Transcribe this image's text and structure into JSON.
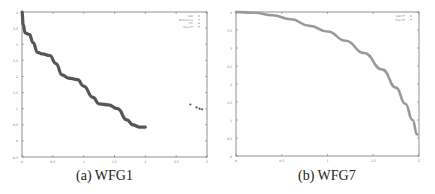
{
  "chart_data": [
    {
      "type": "scatter",
      "caption": "(a) WFG1",
      "title": "",
      "xlabel": "",
      "ylabel": "",
      "xlim": [
        0,
        3
      ],
      "ylim": [
        -0.5,
        4
      ],
      "x_ticks": [
        "0",
        "0.5",
        "1",
        "1.5",
        "2",
        "2.5",
        "3"
      ],
      "y_ticks": [
        "4",
        "3.5",
        "3",
        "2.5",
        "2",
        "1.5",
        "1",
        "0.5",
        "0",
        "-0.5"
      ],
      "grid": false,
      "legend_position": "upper right",
      "legend": [
        "IGD",
        "Reference",
        "HV",
        "True PF"
      ],
      "series": [
        {
          "name": "True PF",
          "color": "#555555",
          "points": [
            [
              0,
              4
            ],
            [
              0.02,
              3.6
            ],
            [
              0.05,
              3.35
            ],
            [
              0.12,
              3.3
            ],
            [
              0.18,
              3.05
            ],
            [
              0.25,
              2.75
            ],
            [
              0.33,
              2.7
            ],
            [
              0.45,
              2.65
            ],
            [
              0.55,
              2.4
            ],
            [
              0.65,
              2.05
            ],
            [
              0.75,
              1.95
            ],
            [
              0.9,
              1.9
            ],
            [
              1.0,
              1.7
            ],
            [
              1.15,
              1.35
            ],
            [
              1.25,
              1.15
            ],
            [
              1.4,
              1.12
            ],
            [
              1.55,
              1.0
            ],
            [
              1.7,
              0.65
            ],
            [
              1.8,
              0.5
            ],
            [
              1.9,
              0.43
            ],
            [
              2.0,
              0.43
            ]
          ]
        },
        {
          "name": "IGD",
          "color": "#555555",
          "points": [
            [
              2.73,
              1.13
            ],
            [
              2.83,
              1.04
            ],
            [
              2.88,
              1.0
            ],
            [
              2.92,
              0.98
            ]
          ]
        }
      ]
    },
    {
      "type": "scatter",
      "caption": "(b) WFG7",
      "title": "",
      "xlabel": "",
      "ylabel": "",
      "xlim": [
        0,
        2
      ],
      "ylim": [
        0,
        4
      ],
      "x_ticks": [
        "0",
        "0.5",
        "1",
        "1.5",
        "2"
      ],
      "y_ticks": [
        "4",
        "3.5",
        "3",
        "2.5",
        "2",
        "1.5",
        "1",
        "0.5",
        "0"
      ],
      "grid": false,
      "legend_position": "upper right",
      "legend": [
        "IGD PF",
        "True PF"
      ],
      "series": [
        {
          "name": "True PF",
          "color": "#999999",
          "points": [
            [
              0,
              4
            ],
            [
              0.2,
              3.98
            ],
            [
              0.4,
              3.91
            ],
            [
              0.6,
              3.8
            ],
            [
              0.8,
              3.62
            ],
            [
              1.0,
              3.46
            ],
            [
              1.2,
              3.2
            ],
            [
              1.4,
              2.86
            ],
            [
              1.6,
              2.4
            ],
            [
              1.75,
              1.9
            ],
            [
              1.85,
              1.45
            ],
            [
              1.93,
              1.0
            ],
            [
              1.98,
              0.6
            ]
          ]
        }
      ]
    }
  ]
}
